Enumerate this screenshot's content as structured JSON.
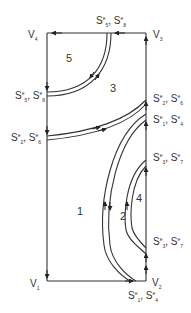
{
  "diagram": {
    "vertices": {
      "v1": {
        "base": "V",
        "sub": "1"
      },
      "v2": {
        "base": "V",
        "sub": "2"
      },
      "v3": {
        "base": "V",
        "sub": "3"
      },
      "v4": {
        "base": "V",
        "sub": "4"
      }
    },
    "seams": {
      "top": {
        "a": {
          "base": "S",
          "sup": "e",
          "sub": "5"
        },
        "b": {
          "base": "S",
          "sup": "e",
          "sub": "8"
        }
      },
      "left_upper": {
        "a": {
          "base": "S",
          "sup": "e",
          "sub": "5"
        },
        "b": {
          "base": "S",
          "sup": "e",
          "sub": "8"
        }
      },
      "right_upper": {
        "a": {
          "base": "S",
          "sup": "e",
          "sub": "2"
        },
        "b": {
          "base": "S",
          "sup": "e",
          "sub": "6"
        }
      },
      "left_lower": {
        "a": {
          "base": "S",
          "sup": "e",
          "sub": "2"
        },
        "b": {
          "base": "S",
          "sup": "e",
          "sub": "6"
        }
      },
      "right_mid": {
        "a": {
          "base": "S",
          "sup": "e",
          "sub": "1"
        },
        "b": {
          "base": "S",
          "sup": "e",
          "sub": "4"
        }
      },
      "right_inner_top": {
        "a": {
          "base": "S",
          "sup": "e",
          "sub": "3"
        },
        "b": {
          "base": "S",
          "sup": "e",
          "sub": "7"
        }
      },
      "right_inner_bottom": {
        "a": {
          "base": "S",
          "sup": "e",
          "sub": "3"
        },
        "b": {
          "base": "S",
          "sup": "e",
          "sub": "7"
        }
      },
      "bottom": {
        "a": {
          "base": "S",
          "sup": "e",
          "sub": "1"
        },
        "b": {
          "base": "S",
          "sup": "e",
          "sub": "4"
        }
      }
    },
    "regions": [
      "1",
      "2",
      "3",
      "4",
      "5"
    ],
    "separator": ","
  }
}
